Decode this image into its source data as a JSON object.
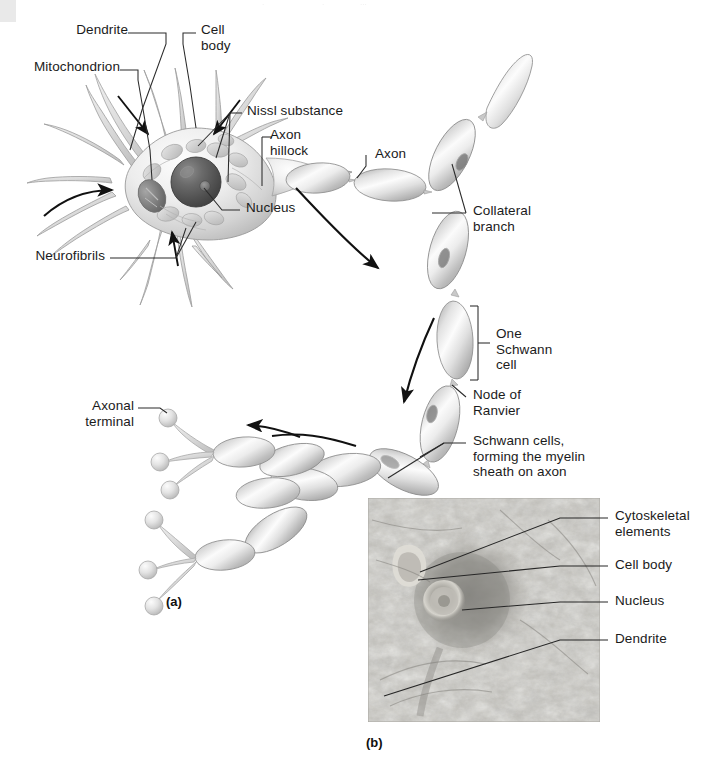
{
  "figure": {
    "background_color": "#ffffff",
    "ink_color": "#1b1b1b",
    "panels": [
      {
        "id": "a",
        "caption": "(a)",
        "kind": "illustration"
      },
      {
        "id": "b",
        "caption": "(b)",
        "kind": "light-micrograph"
      }
    ]
  },
  "panel_a": {
    "caption": "(a)",
    "labels": {
      "dendrite": "Dendrite",
      "cell_body": "Cell\nbody",
      "mitochondrion": "Mitochondrion",
      "nissl_substance": "Nissl substance",
      "axon_hillock": "Axon\nhillock",
      "axon": "Axon",
      "nucleus": "Nucleus",
      "neurofibrils": "Neurofibrils",
      "collateral_branch": "Collateral\nbranch",
      "one_schwann_cell": "One\nSchwann\ncell",
      "node_of_ranvier": "Node of\nRanvier",
      "schwann_cells_myelin": "Schwann cells,\nforming the myelin\nsheath on axon",
      "axonal_terminal": "Axonal\nterminal"
    }
  },
  "panel_b": {
    "caption": "(b)",
    "labels": {
      "cytoskeletal_elements": "Cytoskeletal\nelements",
      "cell_body": "Cell body",
      "nucleus": "Nucleus",
      "dendrite": "Dendrite"
    }
  },
  "colors": {
    "ink": "#1b1b1b",
    "leader_line": "#2a2a2a",
    "cell_fill_light": "#f2f2f2",
    "cell_fill_mid": "#d6d6d6",
    "cell_fill_dark": "#9a9a9a",
    "nucleus_dark": "#4e4e4e",
    "micrograph_base": "#b9b9b3"
  }
}
